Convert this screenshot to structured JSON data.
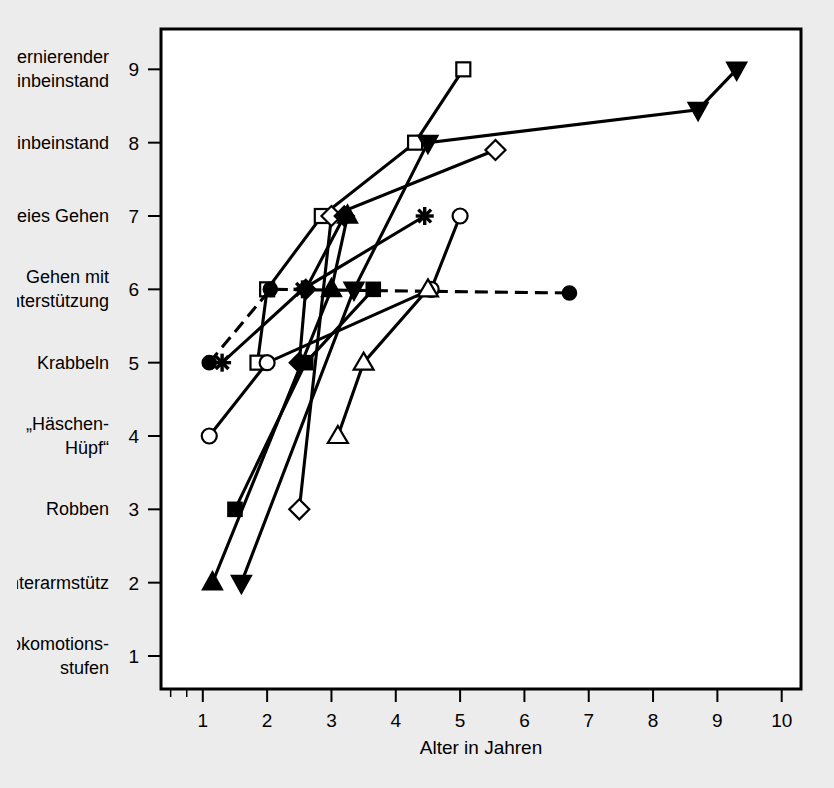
{
  "figure": {
    "background_color": "#edecec",
    "plot_background_color": "#ffffff",
    "frame_color": "#000000"
  },
  "chart_data": {
    "type": "line",
    "title": "",
    "xlabel": "Alter in Jahren",
    "ylabel": "Lokomotionsstufen",
    "xlim": [
      0.35,
      10.3
    ],
    "ylim": [
      0.55,
      9.55
    ],
    "grid": false,
    "legend": "none",
    "x_ticks": [
      1,
      2,
      3,
      4,
      5,
      6,
      7,
      8,
      9,
      10
    ],
    "x_tick_labels": [
      "1",
      "2",
      "3",
      "4",
      "5",
      "6",
      "7",
      "8",
      "9",
      "10"
    ],
    "y_ticks": [
      1,
      2,
      3,
      4,
      5,
      6,
      7,
      8,
      9
    ],
    "y_tick_labels": [
      "1",
      "2",
      "3",
      "4",
      "5",
      "6",
      "7",
      "8",
      "9"
    ],
    "y_category_labels": [
      {
        "value": 9,
        "lines": [
          "alternierender",
          "Einbeinstand"
        ]
      },
      {
        "value": 8,
        "lines": [
          "Einbeinstand"
        ]
      },
      {
        "value": 7,
        "lines": [
          "freies Gehen"
        ]
      },
      {
        "value": 6,
        "lines": [
          "Gehen mit",
          "Unterstützung"
        ]
      },
      {
        "value": 5,
        "lines": [
          "Krabbeln"
        ]
      },
      {
        "value": 4,
        "lines": [
          "„Häschen-",
          "Hüpf“"
        ]
      },
      {
        "value": 3,
        "lines": [
          "Robben"
        ]
      },
      {
        "value": 2,
        "lines": [
          "Unterarmstütz"
        ]
      },
      {
        "value": 1,
        "lines": [
          "Lokomotions-",
          "stufen"
        ]
      }
    ],
    "series": [
      {
        "name": "open-square",
        "marker": "square-open",
        "line_style": "solid",
        "points": [
          [
            1.85,
            5.0
          ],
          [
            2.0,
            6.0
          ],
          [
            2.85,
            7.0
          ],
          [
            4.3,
            8.0
          ],
          [
            5.05,
            9.0
          ]
        ]
      },
      {
        "name": "open-diamond",
        "marker": "diamond-open",
        "line_style": "solid",
        "points": [
          [
            2.5,
            3.0
          ],
          [
            3.0,
            7.0
          ],
          [
            5.55,
            7.9
          ]
        ]
      },
      {
        "name": "filled-diamond",
        "marker": "diamond-filled",
        "line_style": "solid",
        "points": [
          [
            2.5,
            5.0
          ],
          [
            2.6,
            6.0
          ],
          [
            3.2,
            7.0
          ]
        ]
      },
      {
        "name": "filled-square",
        "marker": "square-filled",
        "line_style": "solid",
        "points": [
          [
            1.5,
            3.0
          ],
          [
            2.6,
            5.0
          ],
          [
            3.65,
            6.0
          ]
        ]
      },
      {
        "name": "filled-circle",
        "marker": "circle-filled",
        "line_style": "dashed",
        "points": [
          [
            1.1,
            5.0
          ],
          [
            2.05,
            6.0
          ],
          [
            6.7,
            5.95
          ]
        ]
      },
      {
        "name": "open-circle",
        "marker": "circle-open",
        "line_style": "solid",
        "points": [
          [
            1.1,
            4.0
          ],
          [
            2.0,
            5.0
          ],
          [
            4.55,
            6.0
          ],
          [
            5.0,
            7.0
          ]
        ]
      },
      {
        "name": "star",
        "marker": "star",
        "line_style": "solid",
        "points": [
          [
            1.3,
            5.0
          ],
          [
            2.55,
            6.0
          ],
          [
            4.45,
            7.0
          ]
        ]
      },
      {
        "name": "open-triangle",
        "marker": "triangle-open",
        "line_style": "solid",
        "points": [
          [
            3.1,
            4.0
          ],
          [
            3.5,
            5.0
          ],
          [
            4.5,
            6.0
          ]
        ]
      },
      {
        "name": "filled-up-triangle",
        "marker": "triangle-filled",
        "line_style": "solid",
        "points": [
          [
            1.15,
            2.0
          ],
          [
            3.0,
            6.0
          ],
          [
            3.25,
            7.0
          ]
        ]
      },
      {
        "name": "filled-down-triangle",
        "marker": "triangle-down-filled",
        "line_style": "solid",
        "points": [
          [
            1.6,
            2.0
          ],
          [
            3.35,
            6.0
          ],
          [
            4.5,
            8.0
          ],
          [
            8.7,
            8.45
          ],
          [
            9.3,
            9.0
          ]
        ]
      }
    ]
  }
}
